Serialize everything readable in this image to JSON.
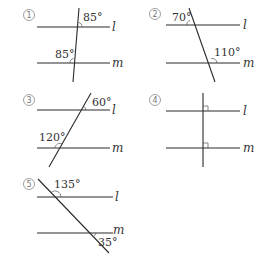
{
  "figures": [
    {
      "id": "1",
      "marker": "1",
      "line_labels": [
        "l",
        "m"
      ],
      "angles": [
        "85°",
        "85°"
      ]
    },
    {
      "id": "2",
      "marker": "2",
      "line_labels": [
        "l",
        "m"
      ],
      "angles": [
        "70°",
        "110°"
      ]
    },
    {
      "id": "3",
      "marker": "3",
      "line_labels": [
        "l",
        "m"
      ],
      "angles": [
        "60°",
        "120°"
      ]
    },
    {
      "id": "4",
      "marker": "4",
      "line_labels": [
        "l",
        "m"
      ],
      "angles": [
        "right-angle",
        "right-angle"
      ]
    },
    {
      "id": "5",
      "marker": "5",
      "line_labels": [
        "l",
        "m"
      ],
      "angles": [
        "135°",
        "35°"
      ]
    }
  ]
}
